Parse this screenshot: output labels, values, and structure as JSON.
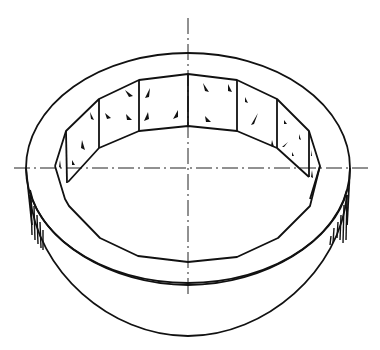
{
  "figure": {
    "colors": {
      "line": "#111111",
      "background": "#ffffff"
    },
    "center": {
      "x": 188,
      "y": 168
    },
    "outer_ellipse_top": {
      "cx": 188,
      "cy": 168,
      "rx": 162,
      "ry": 115
    },
    "outer_ellipse_bottom": {
      "cx": 188,
      "cy": 218,
      "rx": 162,
      "ry": 118
    },
    "inner_polygon_top": [
      [
        188,
        74
      ],
      [
        139,
        80
      ],
      [
        99,
        99
      ],
      [
        66,
        131
      ],
      [
        55,
        166
      ],
      [
        65,
        199
      ],
      [
        69,
        176
      ]
    ],
    "axes": {
      "vertical_x": 188,
      "horizontal_y": 168
    }
  }
}
